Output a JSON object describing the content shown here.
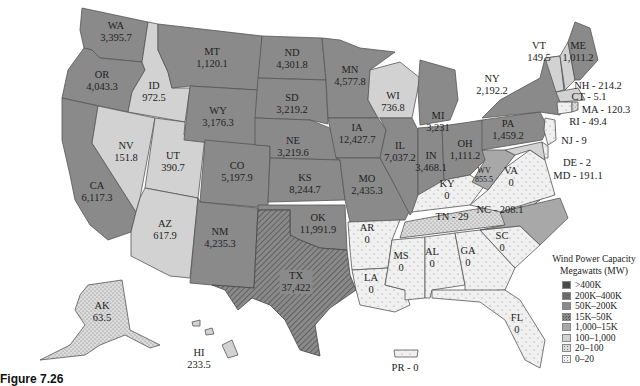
{
  "title": "Wind Power Capacity",
  "subtitle": "Megawatts (MW)",
  "caption": "Figure 7.26",
  "legend": [
    {
      "label": ">400K",
      "color": "#4a4a4a",
      "pattern": "solid"
    },
    {
      "label": "200K–400K",
      "color": "#6a6a6a",
      "pattern": "solid"
    },
    {
      "label": "50K–200K",
      "color": "#8a8a8a",
      "pattern": "solid"
    },
    {
      "label": "15K–50K",
      "color": "#8a8a8a",
      "pattern": "crosshatch"
    },
    {
      "label": "1,000–15K",
      "color": "#a8a8a8",
      "pattern": "solid"
    },
    {
      "label": "100–1,000",
      "color": "#d2d2d2",
      "pattern": "solid"
    },
    {
      "label": "20–100",
      "color": "#dcdcdc",
      "pattern": "dots-dense"
    },
    {
      "label": "0–20",
      "color": "#f0f0f0",
      "pattern": "dots"
    }
  ],
  "states": {
    "WA": {
      "abbr": "WA",
      "value": "3,395.7"
    },
    "OR": {
      "abbr": "OR",
      "value": "4,043.3"
    },
    "CA": {
      "abbr": "CA",
      "value": "6,117.3"
    },
    "ID": {
      "abbr": "ID",
      "value": "972.5"
    },
    "NV": {
      "abbr": "NV",
      "value": "151.8"
    },
    "UT": {
      "abbr": "UT",
      "value": "390.7"
    },
    "AZ": {
      "abbr": "AZ",
      "value": "617.9"
    },
    "MT": {
      "abbr": "MT",
      "value": "1,120.1"
    },
    "WY": {
      "abbr": "WY",
      "value": "3,176.3"
    },
    "CO": {
      "abbr": "CO",
      "value": "5,197.9"
    },
    "NM": {
      "abbr": "NM",
      "value": "4,235.3"
    },
    "ND": {
      "abbr": "ND",
      "value": "4,301.8"
    },
    "SD": {
      "abbr": "SD",
      "value": "3,219.2"
    },
    "NE": {
      "abbr": "NE",
      "value": "3,219.6"
    },
    "KS": {
      "abbr": "KS",
      "value": "8,244.7"
    },
    "OK": {
      "abbr": "OK",
      "value": "11,991.9"
    },
    "TX": {
      "abbr": "TX",
      "value": "37,422"
    },
    "MN": {
      "abbr": "MN",
      "value": "4,577.8"
    },
    "IA": {
      "abbr": "IA",
      "value": "12,427.7"
    },
    "MO": {
      "abbr": "MO",
      "value": "2,435.3"
    },
    "AR": {
      "abbr": "AR",
      "value": "0"
    },
    "LA": {
      "abbr": "LA",
      "value": "0"
    },
    "WI": {
      "abbr": "WI",
      "value": "736.8"
    },
    "IL": {
      "abbr": "IL",
      "value": "7,037.2"
    },
    "MI": {
      "abbr": "MI",
      "value": "3,231"
    },
    "IN": {
      "abbr": "IN",
      "value": "3,468.1"
    },
    "OH": {
      "abbr": "OH",
      "value": "1,111.2"
    },
    "KY": {
      "abbr": "KY",
      "value": "0"
    },
    "TN": {
      "abbr": "TN",
      "value": "29"
    },
    "MS": {
      "abbr": "MS",
      "value": "0"
    },
    "AL": {
      "abbr": "AL",
      "value": "0"
    },
    "GA": {
      "abbr": "GA",
      "value": "0"
    },
    "FL": {
      "abbr": "FL",
      "value": "0"
    },
    "SC": {
      "abbr": "SC",
      "value": "0"
    },
    "NC": {
      "abbr": "NC",
      "value": "208.1"
    },
    "VA": {
      "abbr": "VA",
      "value": "0"
    },
    "WV": {
      "abbr": "WV",
      "value": "855.5"
    },
    "PA": {
      "abbr": "PA",
      "value": "1,459.2"
    },
    "NY": {
      "abbr": "NY",
      "value": "2,192.2"
    },
    "VT": {
      "abbr": "VT",
      "value": "149.5"
    },
    "ME": {
      "abbr": "ME",
      "value": "1,011.2"
    },
    "NH": {
      "abbr": "NH",
      "value": "214.2"
    },
    "MA": {
      "abbr": "MA",
      "value": "120.3"
    },
    "CT": {
      "abbr": "CT",
      "value": "5.1"
    },
    "RI": {
      "abbr": "RI",
      "value": "49.4"
    },
    "NJ": {
      "abbr": "NJ",
      "value": "9"
    },
    "DE": {
      "abbr": "DE",
      "value": "2"
    },
    "MD": {
      "abbr": "MD",
      "value": "191.1"
    },
    "AK": {
      "abbr": "AK",
      "value": "63.5"
    },
    "HI": {
      "abbr": "HI",
      "value": "233.5"
    },
    "PR": {
      "abbr": "PR",
      "value": "0"
    }
  },
  "inline_labels": {
    "NH": "NH - 214.2",
    "CT": "CT - 5.1",
    "MA": "MA - 120.3",
    "RI": "RI - 49.4",
    "NJ": "NJ - 9",
    "DE": "DE - 2",
    "MD": "MD - 191.1",
    "TN": "TN - 29",
    "NC": "NC - 208.1",
    "PR": "PR - 0"
  }
}
